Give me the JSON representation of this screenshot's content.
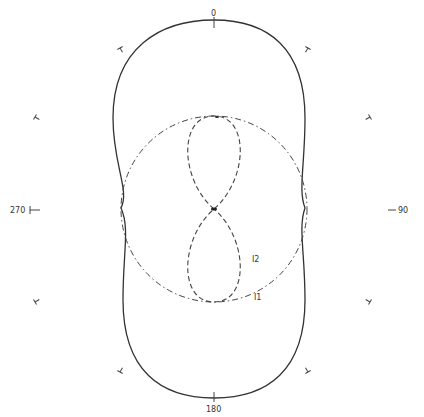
{
  "diagram": {
    "type": "polar radiation pattern",
    "angle_labels": {
      "top": "0",
      "right": "90",
      "bottom": "180",
      "left": "270"
    },
    "curve_labels": {
      "dashed": "I2",
      "dash_dot": "I1"
    },
    "colors": {
      "line": "#333333",
      "background": "#ffffff"
    }
  }
}
